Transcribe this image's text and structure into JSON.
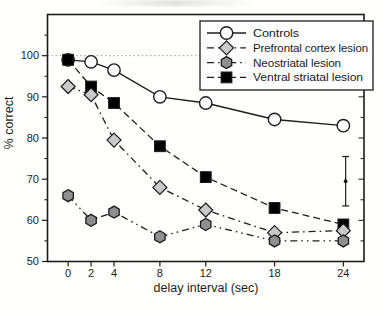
{
  "chart_data": {
    "type": "line",
    "title": "",
    "xlabel": "delay interval (sec)",
    "ylabel": "% correct",
    "x": [
      0,
      2,
      4,
      8,
      12,
      18,
      24
    ],
    "x_tick_labels": [
      "0",
      "2",
      "4",
      "8",
      "12",
      "18",
      "24"
    ],
    "y_ticks": [
      50,
      60,
      70,
      80,
      90,
      100
    ],
    "y_tick_labels": [
      "50",
      "60",
      "70",
      "80",
      "90",
      "100"
    ],
    "y_minor_ticks": [
      55,
      65,
      75,
      85,
      95,
      105
    ],
    "xlim": [
      -1.8,
      25.8
    ],
    "ylim": [
      50,
      110
    ],
    "grid": false,
    "reference_line": {
      "y": 100,
      "style": "dotted",
      "color": "#9c9c9c"
    },
    "series": [
      {
        "name": "Controls",
        "marker": "circle",
        "marker_fill": "#ffffff",
        "line": "solid",
        "values": [
          99,
          98.5,
          96.5,
          90,
          88.5,
          84.5,
          83
        ]
      },
      {
        "name": "Prefrontal cortex lesion",
        "marker": "diamond",
        "marker_fill": "#c9c9c9",
        "line": "dash-dot",
        "values": [
          92.5,
          90.5,
          79.5,
          68,
          62.5,
          57,
          57.5
        ]
      },
      {
        "name": "Neostriatal lesion",
        "marker": "hexagon",
        "marker_fill": "#8f8f8f",
        "line": "dash-dot-dot",
        "values": [
          66,
          60,
          62,
          56,
          59,
          55,
          55
        ]
      },
      {
        "name": "Ventral striatal lesion",
        "marker": "square",
        "marker_fill": "#000000",
        "line": "dashed",
        "values": [
          99,
          92.5,
          88.5,
          78,
          70.5,
          63,
          59
        ]
      }
    ],
    "draw_order": [
      0,
      3,
      1,
      2
    ],
    "error_bar": {
      "x": 24.2,
      "center": 69.5,
      "upper": 75.5,
      "lower": 63.5
    },
    "legend": {
      "position": "top-right",
      "border": true,
      "entries": [
        "Controls",
        "Prefrontal cortex lesion",
        "Neostriatal lesion",
        "Ventral striatal lesion"
      ]
    },
    "colors": {
      "axis": "#1c1c1c",
      "text": "#1c1c1c",
      "background": "#ffffff"
    }
  }
}
